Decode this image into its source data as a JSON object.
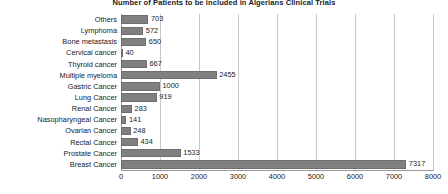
{
  "chart_data": {
    "type": "bar",
    "orientation": "horizontal",
    "title": "Number of Patients to be included in Algerians Clinical Trials",
    "xlabel": "",
    "ylabel": "",
    "xlim": [
      0,
      8000
    ],
    "xticks": [
      0,
      1000,
      2000,
      3000,
      4000,
      5000,
      6000,
      7000,
      8000
    ],
    "grid": true,
    "legend": false,
    "bar_color": "#808080",
    "bar_edge_color": "#6e6e6e",
    "grid_color": "#c8c8c8",
    "axis_color": "#9a9a9a",
    "text_color": "#1a1a1a",
    "background": "#ffffff",
    "show_value_labels": true,
    "categories": [
      "Others",
      "Lymphoma",
      "Bone metastasis",
      "Cervical cancer",
      "Thyroid cancer",
      "Multiple myeloma",
      "Gastric Cancer",
      "Lung Cancer",
      "Renal Cancer",
      "Nasopharyngeal Cancer",
      "Ovarian Cancer",
      "Rectal Cancer",
      "Prostate Cancer",
      "Breast Cancer"
    ],
    "values": [
      703,
      572,
      650,
      40,
      667,
      2455,
      1000,
      919,
      283,
      141,
      248,
      434,
      1533,
      7317
    ]
  }
}
